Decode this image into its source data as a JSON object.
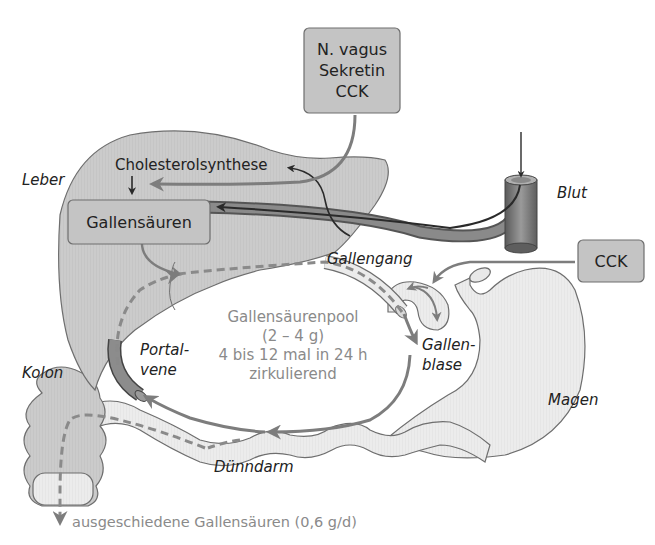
{
  "colors": {
    "organ_fill": "#c9c9c9",
    "organ_light": "#e4e4e4",
    "organ_stroke": "#6e6e6e",
    "box_fill": "#c4c4c4",
    "arrow_gray": "#7d7d7d",
    "arrow_dark": "#2a2a2a",
    "pool_text": "#8a8a8a",
    "vessel": "#6a6a6a"
  },
  "boxes": {
    "regulators": {
      "lines": [
        "N. vagus",
        "Sekretin",
        "CCK"
      ]
    },
    "cck": {
      "label": "CCK"
    },
    "bile_acids": {
      "label": "Gallensäuren"
    }
  },
  "labels": {
    "cholesterol": "Cholesterolsynthese",
    "liver": "Leber",
    "blood": "Blut",
    "bile_duct": "Gallengang",
    "gallbladder": [
      "Gallen-",
      "blase"
    ],
    "portal_vein": [
      "Portal-",
      "vene"
    ],
    "colon": "Kolon",
    "stomach": "Magen",
    "small_intestine": "Dünndarm"
  },
  "pool": {
    "lines": [
      "Gallensäurenpool",
      "(2 – 4 g)",
      "4 bis 12 mal in 24 h",
      "zirkulierend"
    ]
  },
  "excretion": {
    "label": "ausgeschiedene Gallensäuren (0,6 g/d)"
  }
}
